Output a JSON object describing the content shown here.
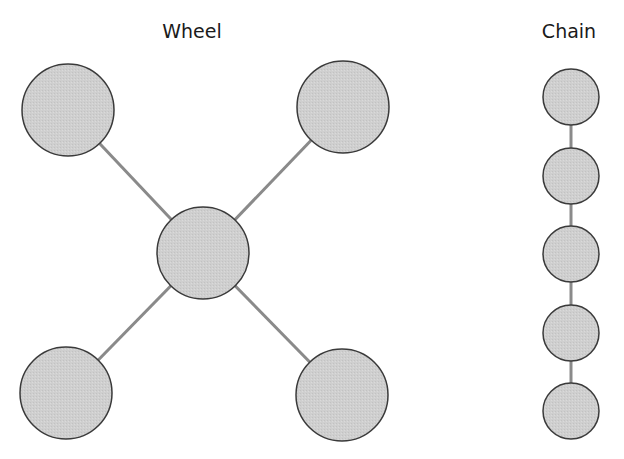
{
  "colors": {
    "node_fill": "#cfcfcf",
    "node_stroke": "#3a3a3a",
    "edge": "#8a8a8a",
    "text": "#1a1a1a"
  },
  "diagrams": [
    {
      "title": "Wheel",
      "title_pos": {
        "x": 192,
        "y": 24
      },
      "nodes": [
        {
          "id": "top-left",
          "cx": 68,
          "cy": 110,
          "r": 46
        },
        {
          "id": "top-right",
          "cx": 343,
          "cy": 107,
          "r": 46
        },
        {
          "id": "center",
          "cx": 203,
          "cy": 253,
          "r": 46
        },
        {
          "id": "bottom-left",
          "cx": 66,
          "cy": 393,
          "r": 46
        },
        {
          "id": "bottom-right",
          "cx": 342,
          "cy": 395,
          "r": 46
        }
      ],
      "edges": [
        [
          "center",
          "top-left"
        ],
        [
          "center",
          "top-right"
        ],
        [
          "center",
          "bottom-left"
        ],
        [
          "center",
          "bottom-right"
        ]
      ]
    },
    {
      "title": "Chain",
      "title_pos": {
        "x": 569,
        "y": 24
      },
      "nodes": [
        {
          "id": "c1",
          "cx": 571,
          "cy": 97,
          "r": 28
        },
        {
          "id": "c2",
          "cx": 571,
          "cy": 176,
          "r": 28
        },
        {
          "id": "c3",
          "cx": 571,
          "cy": 254,
          "r": 28
        },
        {
          "id": "c4",
          "cx": 571,
          "cy": 333,
          "r": 28
        },
        {
          "id": "c5",
          "cx": 571,
          "cy": 411,
          "r": 28
        }
      ],
      "edges": [
        [
          "c1",
          "c2"
        ],
        [
          "c2",
          "c3"
        ],
        [
          "c3",
          "c4"
        ],
        [
          "c4",
          "c5"
        ]
      ]
    }
  ]
}
